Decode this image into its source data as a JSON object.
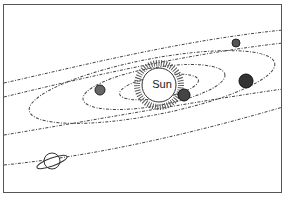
{
  "diagram": {
    "sun": {
      "label": "Sun"
    },
    "planets": [
      {
        "name": "inner-planet-left"
      },
      {
        "name": "planet-near-sun"
      },
      {
        "name": "planet-right-large"
      },
      {
        "name": "planet-top-right"
      },
      {
        "name": "ringed-planet"
      }
    ],
    "colors": {
      "ink": "#333333",
      "background": "#ffffff",
      "border": "#555555"
    }
  }
}
